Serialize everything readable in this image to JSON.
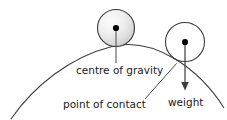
{
  "diagram": {
    "labels": {
      "centre_of_gravity": "centre of gravity",
      "point_of_contact": "point of contact",
      "weight": "weight"
    },
    "colors": {
      "background": "#ffffff",
      "line": "#3d3d3d",
      "text": "#1a1a1a",
      "sphere_fill_light": "#f5f5f5",
      "sphere_fill_dark": "#c9c9c9",
      "dot": "#000000"
    },
    "objects": {
      "shaded_sphere": {
        "cx": 116,
        "cy": 28,
        "r": 18.5,
        "fill": "shaded-gray-gradient"
      },
      "open_sphere": {
        "cx": 185,
        "cy": 42,
        "r": 19.5,
        "fill": "none"
      },
      "surface_arc": {
        "type": "convex-curve",
        "left_end_x": 11,
        "left_end_y": 119,
        "apex_x": 112,
        "apex_y": 46,
        "right_end_x": 224,
        "right_end_y": 108
      },
      "weight_arrow": {
        "from_x": 185,
        "from_y": 42,
        "to_x": 185,
        "to_y": 90,
        "direction": "down",
        "head": "filled-triangle"
      },
      "cog_leader": {
        "from_x": 116,
        "from_y": 28,
        "to_x": 116,
        "to_y": 62
      },
      "contact_leader": {
        "from_x": 145,
        "from_y": 99,
        "to_x": 176,
        "to_y": 64
      }
    }
  }
}
